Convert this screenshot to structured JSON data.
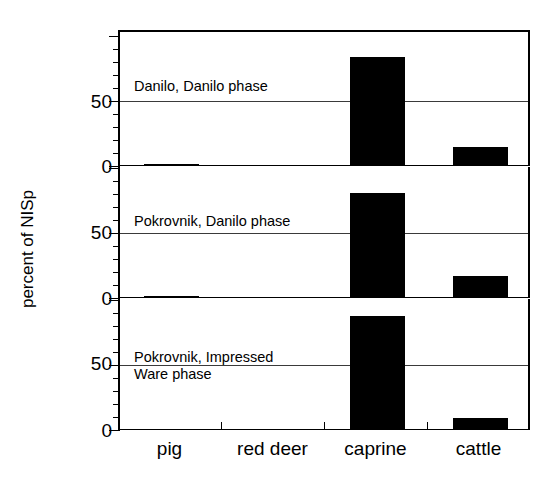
{
  "chart_data": {
    "type": "bar",
    "title": "",
    "subtitle": "",
    "xlabel": "",
    "ylabel": "percent of NISp",
    "categories": [
      "pig",
      "red deer",
      "caprine",
      "cattle"
    ],
    "ylim": [
      0,
      100
    ],
    "yticks": [
      0,
      50
    ],
    "ytick_labels": [
      "0",
      "50"
    ],
    "grid": true,
    "legend_position": "none",
    "panel_layout": "stacked-vertical",
    "panels": [
      {
        "annotation": "Danilo, Danilo phase",
        "values": [
          1,
          0,
          84,
          15
        ]
      },
      {
        "annotation": "Pokrovnik, Danilo phase",
        "values": [
          0.5,
          0,
          81,
          17
        ]
      },
      {
        "annotation": "Pokrovnik, Impressed\nWare phase",
        "values": [
          0,
          0,
          88,
          9
        ]
      }
    ],
    "bar_color": "#000000",
    "axis_color": "#000000",
    "grid_color": "#3a3a3a",
    "background": "#ffffff"
  },
  "axis": {
    "y_title": "percent of NISp",
    "tick_labels": [
      "50",
      "0",
      "50",
      "0",
      "50",
      "0"
    ]
  },
  "x_categories": {
    "labels": [
      "pig",
      "red deer",
      "caprine",
      "cattle"
    ]
  },
  "panel_annotations": {
    "p0": "Danilo, Danilo phase",
    "p1": "Pokrovnik, Danilo phase",
    "p2": "Pokrovnik, Impressed\nWare phase"
  }
}
